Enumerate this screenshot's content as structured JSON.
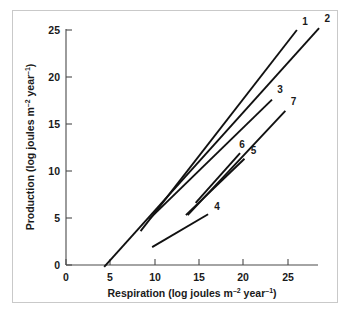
{
  "figure": {
    "background_color": "#ffffff",
    "frame_color": "#c9c9c9",
    "line_color": "#111111",
    "axis_color": "#4a4a4a"
  },
  "chart_data": {
    "type": "line",
    "title": "",
    "xlabel": "Respiration (log joules m⁻² year⁻¹)",
    "ylabel": "Production (log joules m⁻² year⁻¹)",
    "xlim": [
      0,
      28.5
    ],
    "ylim": [
      -0.6,
      26
    ],
    "xticks": [
      0,
      5,
      10,
      15,
      20,
      25
    ],
    "yticks": [
      0,
      5,
      10,
      15,
      20,
      25
    ],
    "xticklabels": [
      "0",
      "5",
      "10",
      "15",
      "20",
      "25"
    ],
    "yticklabels": [
      "0",
      "5",
      "10",
      "15",
      "20",
      "25"
    ],
    "grid": false,
    "legend": "inline-end-labels",
    "series": [
      {
        "name": "1",
        "label": "1",
        "x": [
          8.4,
          26.0
        ],
        "y": [
          3.6,
          25.0
        ],
        "label_x": 26.6,
        "label_y": 25.5
      },
      {
        "name": "2",
        "label": "2",
        "x": [
          4.3,
          28.5
        ],
        "y": [
          -0.2,
          25.2
        ],
        "label_x": 29.1,
        "label_y": 25.8
      },
      {
        "name": "3",
        "label": "3",
        "x": [
          9.4,
          23.2
        ],
        "y": [
          4.9,
          17.6
        ],
        "label_x": 23.8,
        "label_y": 18.3
      },
      {
        "name": "4",
        "label": "4",
        "x": [
          9.7,
          16.0
        ],
        "y": [
          1.9,
          5.4
        ],
        "label_x": 16.7,
        "label_y": 5.9
      },
      {
        "name": "5",
        "label": "5",
        "x": [
          13.5,
          20.1
        ],
        "y": [
          5.3,
          11.3
        ],
        "label_x": 20.8,
        "label_y": 11.8
      },
      {
        "name": "6",
        "label": "6",
        "x": [
          14.6,
          19.6
        ],
        "y": [
          6.6,
          11.9
        ],
        "label_x": 19.5,
        "label_y": 12.5
      },
      {
        "name": "7",
        "label": "7",
        "x": [
          13.7,
          24.7
        ],
        "y": [
          5.3,
          16.4
        ],
        "label_x": 25.3,
        "label_y": 17.0
      }
    ],
    "axis_title_parts": {
      "x_main": "Respiration (log joules m",
      "x_sup1": "–2",
      "x_mid": " year",
      "x_sup2": "–1",
      "x_end": ")",
      "y_main": "Production (log joules m",
      "y_sup1": "–2",
      "y_mid": " year",
      "y_sup2": "–1",
      "y_end": ")"
    }
  }
}
